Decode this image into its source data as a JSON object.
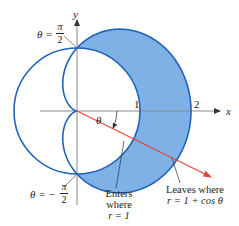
{
  "figure": {
    "type": "polar-region",
    "axes": {
      "x_label": "x",
      "y_label": "y",
      "tick_1": "1",
      "tick_2": "2"
    },
    "curves": [
      {
        "name": "unit-circle",
        "equation": "r = 1"
      },
      {
        "name": "cardioid",
        "equation": "r = 1 + cos θ"
      }
    ],
    "colors": {
      "curve": "#1f63b8",
      "fill": "#7fb1e6",
      "ray": "#e8423a",
      "axis": "#777777",
      "text": "#222222"
    },
    "angle_label": "θ",
    "top_label": {
      "lhs": "θ =",
      "num": "π",
      "den": "2"
    },
    "bottom_label": {
      "lhs": "θ = −",
      "num": "π",
      "den": "2"
    },
    "enters_label": {
      "line1": "Enters",
      "line2": "where",
      "line3": "r = 1"
    },
    "leaves_label": {
      "line1": "Leaves where",
      "line2": "r = 1 + cos θ"
    }
  }
}
